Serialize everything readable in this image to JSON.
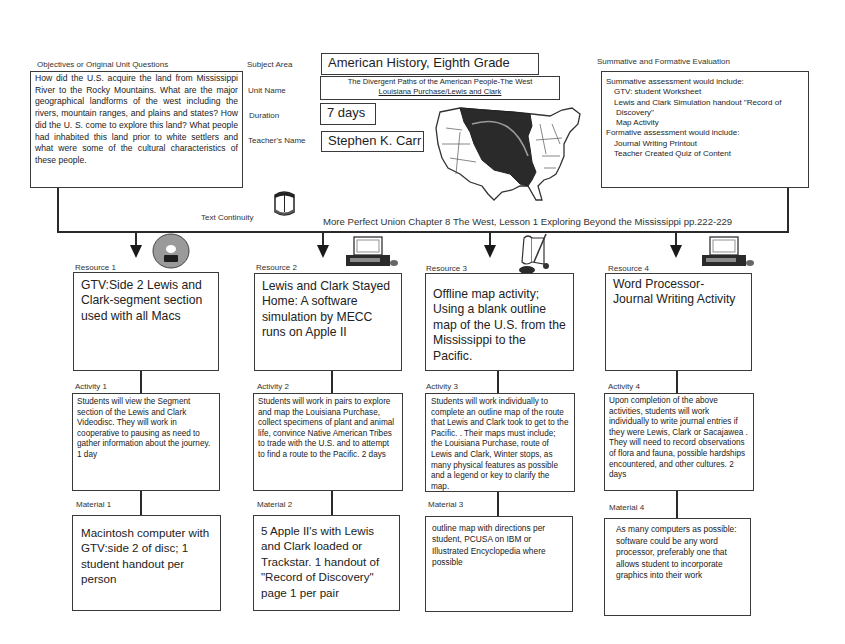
{
  "objectives": {
    "label": "Objectives or Original Unit Questions",
    "text": "How did the U.S. acquire the land from Mississippi River to the Rocky Mountains. What are the major geographical landforms of the west including the rivers, mountain ranges,  and plains and states? How did the U. S. come to explore this land? What people had inhabited this land prior to white settlers and what were some of the cultural characteristics of these people."
  },
  "unit_info": {
    "subject_area_label": "Subject Area",
    "subject_area": "American History, Eighth Grade",
    "unit_name_label": "Unit Name",
    "unit_name_line1": "The Divergent Paths of the American People-The West",
    "unit_name_line2": "Louisiana Purchase/Lewis and Clark",
    "duration_label": "Duration",
    "duration": "7 days",
    "teacher_label": "Teacher's Name",
    "teacher": "Stephen K. Carr"
  },
  "evaluation": {
    "label": "Summative and Formative Evaluation",
    "summative_heading": "Summative assessment would include:",
    "summative_items": [
      "GTV: student Worksheet",
      "Lewis and Clark Simulation handout \"Record of",
      "Discovery\"",
      "Map Activity"
    ],
    "formative_heading": "Formative assessment would include:",
    "formative_items": [
      "Journal Writing Printout",
      "Teacher Created Quiz of Content"
    ]
  },
  "text_continuity": {
    "label": "Text Continuity",
    "text": "More Perfect Union Chapter 8 The West, Lesson 1 Exploring Beyond the Mississippi pp.222-229"
  },
  "columns": [
    {
      "resource_label": "Resource 1",
      "resource": "GTV:Side 2 Lewis and Clark-segment section used with all Macs",
      "resource_icon": "videodisc-icon",
      "activity_label": "Activity 1",
      "activity": "Students will view the Segment section of the Lewis and Clark Videodisc.  They will work in cooperative to pausing as need to gather information about the journey. 1 day",
      "material_label": "Material 1",
      "material": "Macintosh computer with GTV:side 2 of disc; 1 student handout per person"
    },
    {
      "resource_label": "Resource 2",
      "resource": "Lewis and Clark Stayed Home: A software simulation by MECC runs on Apple II",
      "resource_icon": "computer-icon",
      "activity_label": "Activity 2",
      "activity": "Students will work in pairs to explore and map the Louisiana Purchase, collect specimens of plant and animal life, convince Native American Tribes to trade with the U.S. and to attempt to find a route to the Pacific. 2 days",
      "material_label": "Material 2",
      "material": "5 Apple II's with Lewis and Clark loaded or Trackstar.  1 handout of \"Record of Discovery\" page 1 per pair"
    },
    {
      "resource_label": "Resource 3",
      "resource": "Offline map activity; Using a blank outline map of the U.S. from the Mississippi to the Pacific.",
      "resource_icon": "scroll-quill-icon",
      "activity_label": "Activity 3",
      "activity": "Students will work individually  to complete an outline map of the route that Lewis and Clark took to get to the Pacific.  . Their maps must include; the Louisiana Purchase, route of Lewis and Clark, Winter stops, as many physical features as possible and a legend or key to clarify the map.",
      "material_label": "Material 3",
      "material": "outline map with directions per student,  PCUSA on IBM or Illustrated Encyclopedia where possible"
    },
    {
      "resource_label": "Resource 4",
      "resource": "Word Processor- Journal Writing Activity",
      "resource_icon": "computer-icon",
      "activity_label": "Activity 4",
      "activity": "Upon completion of the above activities, students will work individually to write journal entries if they were Lewis, Clark or Sacajawea . They will need to record observations of flora and fauna, possible hardships encountered, and other cultures.  2 days",
      "material_label": "Material 4",
      "material": "As many computers as possible: software could be any word processor, preferably one that allows student to incorporate graphics into their work"
    }
  ],
  "icons": {
    "map": "us-map-louisiana-purchase-icon",
    "book": "book-icon"
  }
}
